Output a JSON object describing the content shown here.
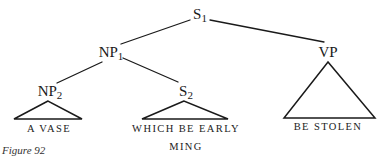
{
  "diagram": {
    "type": "syntax-tree",
    "nodes": {
      "s1": {
        "label": "S",
        "subscript": "1"
      },
      "np1": {
        "label": "NP",
        "subscript": "1"
      },
      "vp": {
        "label": "VP",
        "subscript": ""
      },
      "np2": {
        "label": "NP",
        "subscript": "2"
      },
      "s2": {
        "label": "S",
        "subscript": "2"
      }
    },
    "leaves": {
      "np2_text": "A VASE",
      "s2_text_line1": "WHICH BE EARLY",
      "s2_text_line2": "MING",
      "vp_text": "BE STOLEN"
    },
    "edges": [
      {
        "from": "S1",
        "to": "NP1"
      },
      {
        "from": "S1",
        "to": "VP"
      },
      {
        "from": "NP1",
        "to": "NP2"
      },
      {
        "from": "NP1",
        "to": "S2"
      },
      {
        "from": "NP2",
        "to": "triangle:A VASE"
      },
      {
        "from": "S2",
        "to": "triangle:WHICH BE EARLY MING"
      },
      {
        "from": "VP",
        "to": "triangle:BE STOLEN"
      }
    ],
    "caption": "Figure 92",
    "line_color": "#1a1a1a"
  }
}
